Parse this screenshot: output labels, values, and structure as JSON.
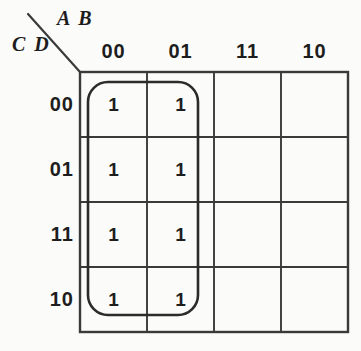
{
  "figure": {
    "type": "karnaugh-map",
    "variables_top": "A B",
    "variables_side": "C D"
  },
  "column_headers": [
    "00",
    "01",
    "11",
    "10"
  ],
  "row_headers": [
    "00",
    "01",
    "11",
    "10"
  ],
  "cells": [
    [
      "1",
      "1",
      "",
      ""
    ],
    [
      "1",
      "1",
      "",
      ""
    ],
    [
      "1",
      "1",
      "",
      ""
    ],
    [
      "1",
      "1",
      "",
      ""
    ]
  ],
  "groups": [
    {
      "name": "group-columns-00-01",
      "columns": [
        0,
        1
      ],
      "rows": [
        0,
        1,
        2,
        3
      ],
      "cell_count": 8
    }
  ],
  "colors": {
    "background": "#fbfbf9",
    "grid_line": "#3a3a3a",
    "group_outline": "#2b2b2b",
    "text": "#1d1d1d"
  }
}
